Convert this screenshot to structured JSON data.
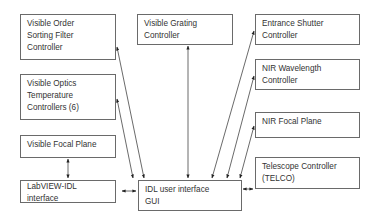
{
  "diagram": {
    "nodes": [
      {
        "id": "vosf",
        "lines": [
          "Visible Order",
          "Sorting Filter",
          "Controller"
        ]
      },
      {
        "id": "vgc",
        "lines": [
          "Visible Grating",
          "Controller"
        ]
      },
      {
        "id": "esc",
        "lines": [
          "Entrance Shutter",
          "Controller"
        ]
      },
      {
        "id": "nwc",
        "lines": [
          "NIR Wavelength",
          "Controller"
        ]
      },
      {
        "id": "votc",
        "lines": [
          "Visible Optics",
          "Temperature",
          "Controllers (6)"
        ]
      },
      {
        "id": "nfp",
        "lines": [
          "NIR Focal Plane"
        ]
      },
      {
        "id": "vfp",
        "lines": [
          "Visible Focal Plane"
        ]
      },
      {
        "id": "telco",
        "lines": [
          "Telescope Controller",
          "(TELCO)"
        ]
      },
      {
        "id": "lvidl",
        "lines": [
          "LabVIEW-IDL",
          "interface"
        ]
      },
      {
        "id": "gui",
        "lines": [
          "IDL user interface",
          "GUI"
        ]
      }
    ],
    "edges": [
      {
        "from": "gui",
        "to": "vosf",
        "style": "bidirectional"
      },
      {
        "from": "gui",
        "to": "votc",
        "style": "bidirectional"
      },
      {
        "from": "gui",
        "to": "vgc",
        "style": "bidirectional"
      },
      {
        "from": "gui",
        "to": "esc",
        "style": "bidirectional"
      },
      {
        "from": "gui",
        "to": "nwc",
        "style": "bidirectional"
      },
      {
        "from": "gui",
        "to": "nfp",
        "style": "bidirectional"
      },
      {
        "from": "gui",
        "to": "telco",
        "style": "bidirectional"
      },
      {
        "from": "gui",
        "to": "lvidl",
        "style": "bidirectional"
      },
      {
        "from": "vfp",
        "to": "lvidl",
        "style": "bidirectional"
      }
    ]
  }
}
